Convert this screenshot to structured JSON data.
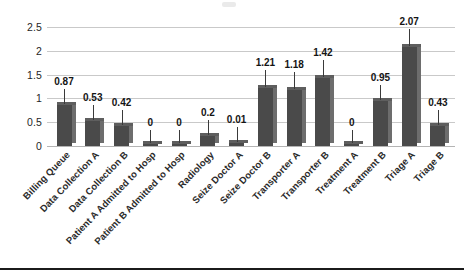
{
  "chart_data": {
    "type": "bar",
    "title": "",
    "xlabel": "",
    "ylabel": "",
    "ylim": [
      0,
      2.5
    ],
    "yticks": [
      "0",
      "0.5",
      "1",
      "1.5",
      "2",
      "2.5"
    ],
    "ytick_values": [
      0,
      0.5,
      1,
      1.5,
      2,
      2.5
    ],
    "grid": true,
    "legend": "none",
    "bar_style": "3d-column",
    "categories": [
      "Billing Queue",
      "Data Collection A",
      "Data Collection B",
      "Patient A Admitted to Hosp",
      "Patient B Admitted to Hosp",
      "Radiology",
      "Seize Doctor A",
      "Seize Doctor B",
      "Transporter A",
      "Transporter B",
      "Treatment A",
      "Treatment B",
      "Triage A",
      "Triage B"
    ],
    "values": [
      0.87,
      0.53,
      0.42,
      0,
      0,
      0.2,
      0.01,
      1.21,
      1.18,
      1.42,
      0,
      0.95,
      2.07,
      0.43
    ],
    "data_labels": [
      "0.87",
      "0.53",
      "0.42",
      "0",
      "0",
      "0.2",
      "0.01",
      "1.21",
      "1.18",
      "1.42",
      "0",
      "0.95",
      "2.07",
      "0.43"
    ]
  },
  "series_display": {
    "points": [
      {
        "category": "Billing Queue",
        "value": 0.87,
        "label": "0.87"
      },
      {
        "category": "Data Collection A",
        "value": 0.53,
        "label": "0.53"
      },
      {
        "category": "Data Collection B",
        "value": 0.42,
        "label": "0.42"
      },
      {
        "category": "Patient A Admitted to Hosp",
        "value": 0,
        "label": "0"
      },
      {
        "category": "Patient B Admitted to Hosp",
        "value": 0.2,
        "label": "0.2"
      },
      {
        "category": "Radiology",
        "value": 0.01,
        "label": "0.01"
      },
      {
        "category": "Seize Doctor A",
        "value": 1.21,
        "label": "1.21"
      },
      {
        "category": "Seize Doctor B",
        "value": 1.18,
        "label": "1.18"
      },
      {
        "category": "Transporter A",
        "value": 1.42,
        "label": "1.42"
      },
      {
        "category": "Transporter B",
        "value": 0,
        "label": "0"
      },
      {
        "category": "Treatment A",
        "value": 0.95,
        "label": "0.95"
      },
      {
        "category": "Treatment B",
        "value": 2.07,
        "label": "2.07"
      },
      {
        "category": "Triage A",
        "value": 0.43,
        "label": "0.43"
      },
      {
        "category": "Triage B",
        "value": 0.46,
        "label": "0.46"
      }
    ]
  },
  "colors": {
    "bar_front": "#4a4a4a",
    "bar_side": "#6d6d6d",
    "bar_top": "#5e5e5e",
    "gridline": "#c9c9c9",
    "text": "#1a1a1a",
    "background": "#ffffff",
    "bottom_rule": "#1b1b1b"
  }
}
